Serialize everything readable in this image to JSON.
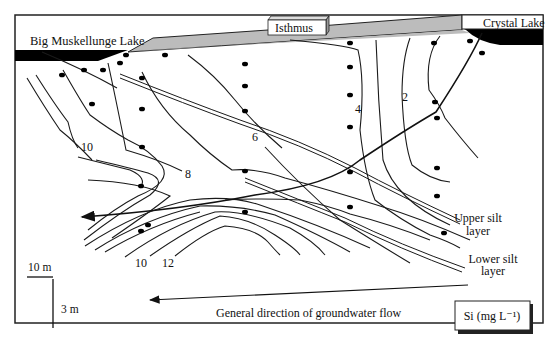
{
  "labels": {
    "left_lake": "Big Muskellunge Lake",
    "isthmus": "Isthmus",
    "right_lake": "Crystal Lake",
    "upper_silt_1": "Upper silt",
    "upper_silt_2": "layer",
    "lower_silt_1": "Lower silt",
    "lower_silt_2": "layer",
    "flow_direction": "General direction of groundwater flow",
    "legend": "Si (mg L⁻¹)"
  },
  "scale_bar": {
    "horizontal": "10 m",
    "vertical": "3 m"
  },
  "contour_labels": [
    {
      "value": "2",
      "x": 430,
      "y": 101
    },
    {
      "value": "4",
      "x": 357,
      "y": 113
    },
    {
      "value": "6",
      "x": 255,
      "y": 141
    },
    {
      "value": "8",
      "x": 188,
      "y": 178
    },
    {
      "value": "10",
      "x": 86,
      "y": 150
    },
    {
      "value": "10",
      "x": 140,
      "y": 264
    },
    {
      "value": "12",
      "x": 167,
      "y": 264
    }
  ],
  "wells": [
    [
      62,
      75
    ],
    [
      84,
      70
    ],
    [
      103,
      70
    ],
    [
      120,
      63
    ],
    [
      92,
      104
    ],
    [
      142,
      78
    ],
    [
      142,
      109
    ],
    [
      142,
      147
    ],
    [
      141,
      186
    ],
    [
      141,
      231
    ],
    [
      245,
      64
    ],
    [
      245,
      86
    ],
    [
      245,
      111
    ],
    [
      245,
      171
    ],
    [
      245,
      212
    ],
    [
      350,
      43
    ],
    [
      350,
      67
    ],
    [
      350,
      95
    ],
    [
      350,
      127
    ],
    [
      350,
      172
    ],
    [
      350,
      207
    ],
    [
      434,
      43
    ],
    [
      435,
      102
    ],
    [
      437,
      118
    ],
    [
      437,
      168
    ],
    [
      437,
      196
    ],
    [
      444,
      233
    ],
    [
      470,
      41
    ],
    [
      482,
      53
    ],
    [
      165,
      55
    ],
    [
      126,
      55
    ],
    [
      148,
      225
    ]
  ],
  "colors": {
    "lake_fill": "#000000",
    "isthmus_fill": "#bcbcbc",
    "frame": "#222222"
  }
}
